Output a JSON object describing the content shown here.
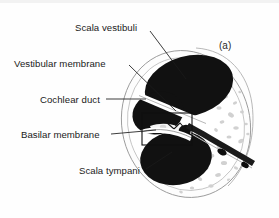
{
  "figure": {
    "panel_letter": "(a)",
    "background_color": "#fefefe",
    "ink_color": "#111111",
    "bone_color": "#d9d9d9",
    "outline_color": "#8d8d8d",
    "leader_color": "#1a1a1a"
  },
  "labels": [
    {
      "id": "scala-vestibuli",
      "text": "Scala vestibuli"
    },
    {
      "id": "vestibular-membrane",
      "text": "Vestibular membrane"
    },
    {
      "id": "cochlear-duct",
      "text": "Cochlear duct"
    },
    {
      "id": "basilar-membrane",
      "text": "Basilar membrane"
    },
    {
      "id": "scala-tympani",
      "text": "Scala tympani"
    }
  ],
  "structures": [
    {
      "id": "scala-vestibuli-chamber",
      "name": "Scala vestibuli"
    },
    {
      "id": "cochlear-duct-chamber",
      "name": "Cochlear duct"
    },
    {
      "id": "scala-tympani-chamber",
      "name": "Scala tympani"
    },
    {
      "id": "vestibular-membrane-band",
      "name": "Vestibular membrane"
    },
    {
      "id": "basilar-membrane-band",
      "name": "Basilar membrane"
    },
    {
      "id": "spiral-lamina",
      "name": "Spiral lamina and nerve"
    },
    {
      "id": "organ-of-corti",
      "name": "Organ of Corti"
    },
    {
      "id": "bony-capsule",
      "name": "Bony capsule"
    }
  ]
}
